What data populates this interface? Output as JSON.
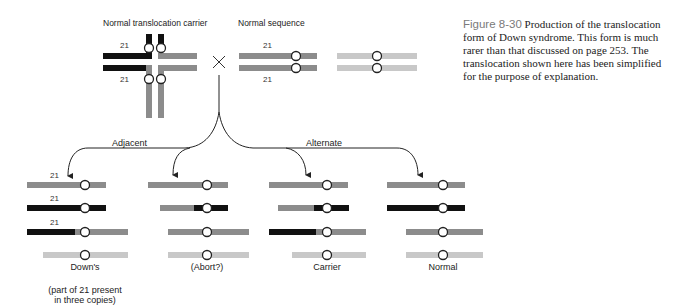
{
  "figure": {
    "number": "Figure 8-30",
    "caption": "Production of the translocation form of Down syndrome. This form is much rarer than that discussed on page 253. The translocation shown here has been simplified for the purpose of explanation."
  },
  "top": {
    "carrier_title": "Normal translocation carrier",
    "normal_title": "Normal sequence",
    "chromosome_label": "21",
    "cross_symbol": "×"
  },
  "branches": {
    "adjacent": "Adjacent",
    "alternate": "Alternate"
  },
  "outcomes": [
    {
      "label": "Down's",
      "note_line1": "(part of 21 present",
      "note_line2": "in three copies)"
    },
    {
      "label": "(Abort?)"
    },
    {
      "label": "Carrier"
    },
    {
      "label": "Normal"
    }
  ],
  "row_labels": {
    "r1": "21",
    "r2": "21",
    "r3": "21"
  },
  "colors": {
    "black": "#111111",
    "dark_gray": "#8c8c8c",
    "light_gray": "#c8c8c8",
    "line": "#222222"
  }
}
